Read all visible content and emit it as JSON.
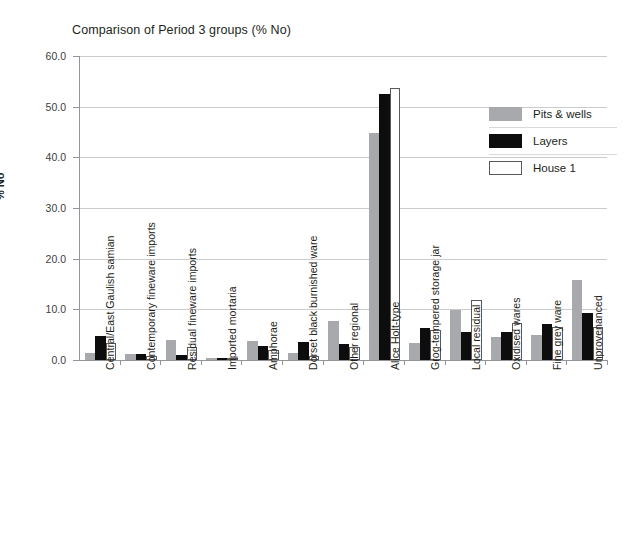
{
  "chart_data": {
    "type": "bar",
    "title": "Comparison of Period 3 groups (% No)",
    "xlabel": "",
    "ylabel": "% No",
    "ylim": [
      0,
      60
    ],
    "ytick_step": 10,
    "ytick_labels": [
      "0.0",
      "10.0",
      "20.0",
      "30.0",
      "40.0",
      "50.0",
      "60.0"
    ],
    "grid": true,
    "legend_position": "right",
    "categories": [
      "Central/East Gaulish samian",
      "Contemporary fineware imports",
      "Residual fineware imports",
      "Imported mortaria",
      "Amphorae",
      "Dorset black burnished ware",
      "Other regional",
      "Alice Holt-type",
      "Grog-tempered storage jar",
      "Local residual",
      "Oxidised wares",
      "Fine grey ware",
      "Unprovenanced"
    ],
    "series": [
      {
        "name": "Pits & wells",
        "color": "#a7a9ac",
        "values": [
          1.3,
          1.1,
          4.0,
          0.4,
          3.8,
          1.4,
          7.7,
          44.8,
          3.4,
          9.9,
          4.6,
          4.9,
          15.8
        ]
      },
      {
        "name": "Layers",
        "color": "#0d0d0d",
        "values": [
          4.8,
          1.2,
          1.0,
          0.3,
          2.8,
          3.5,
          3.1,
          52.5,
          6.3,
          5.5,
          5.6,
          7.2,
          9.3
        ]
      },
      {
        "name": "House 1",
        "color": "#ffffff",
        "values": [
          3.4,
          0.8,
          2.6,
          0.4,
          2.0,
          0.7,
          2.6,
          53.6,
          5.9,
          11.8,
          7.4,
          6.6,
          6.5
        ]
      }
    ]
  },
  "legend": {
    "items": [
      {
        "label": "Pits & wells"
      },
      {
        "label": "Layers"
      },
      {
        "label": "House 1"
      }
    ]
  }
}
